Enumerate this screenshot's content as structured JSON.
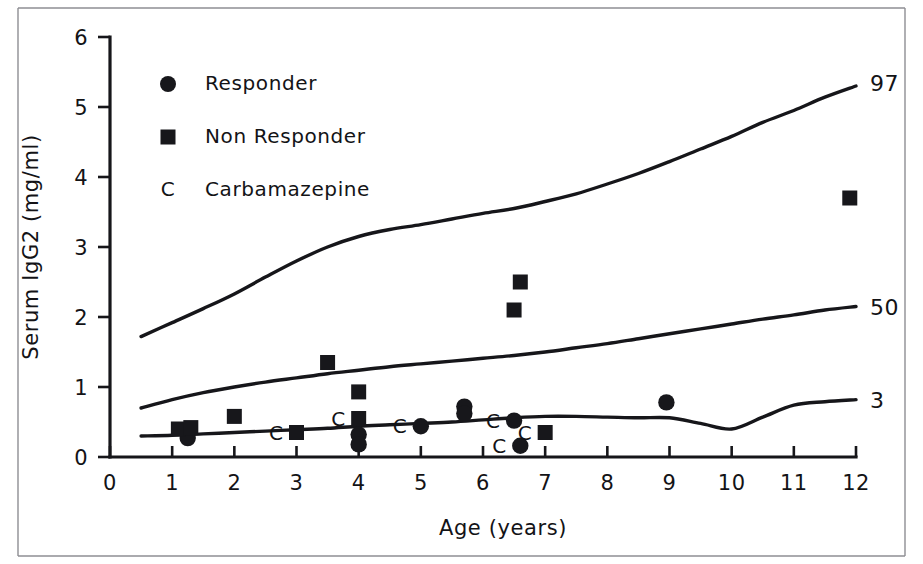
{
  "figure": {
    "background_color": "#ffffff",
    "ink_color": "#16161a"
  },
  "chart_data": {
    "type": "scatter",
    "title": "",
    "xlabel": "Age (years)",
    "ylabel": "Serum IgG2 (mg/ml)",
    "xlim": [
      0,
      12
    ],
    "ylim": [
      0,
      6
    ],
    "xticks": [
      0,
      1,
      2,
      3,
      4,
      5,
      6,
      7,
      8,
      9,
      10,
      11,
      12
    ],
    "xticklabels": [
      "0",
      "1",
      "2",
      "3",
      "4",
      "5",
      "6",
      "7",
      "8",
      "9",
      "10",
      "11",
      "12"
    ],
    "yticks": [
      0,
      1,
      2,
      3,
      4,
      5,
      6
    ],
    "yticklabels": [
      "0",
      "1",
      "2",
      "3",
      "4",
      "5",
      "6"
    ],
    "grid": false,
    "legend_position": "upper-left",
    "legend": [
      {
        "marker": "circle",
        "label": "Responder"
      },
      {
        "marker": "square",
        "label": "Non Responder"
      },
      {
        "marker": "letter-C",
        "label": "Carbamazepine"
      }
    ],
    "reference_curves": [
      {
        "name": "97th percentile",
        "label": "97",
        "label_x": 12.25,
        "label_y": 5.35,
        "points": [
          [
            0.5,
            1.72
          ],
          [
            1.0,
            1.92
          ],
          [
            1.5,
            2.12
          ],
          [
            2.0,
            2.33
          ],
          [
            2.5,
            2.57
          ],
          [
            3.0,
            2.8
          ],
          [
            3.5,
            3.0
          ],
          [
            4.0,
            3.15
          ],
          [
            4.5,
            3.25
          ],
          [
            5.0,
            3.32
          ],
          [
            5.5,
            3.4
          ],
          [
            6.0,
            3.48
          ],
          [
            6.5,
            3.55
          ],
          [
            7.0,
            3.65
          ],
          [
            7.5,
            3.76
          ],
          [
            8.0,
            3.9
          ],
          [
            8.5,
            4.05
          ],
          [
            9.0,
            4.22
          ],
          [
            9.5,
            4.4
          ],
          [
            10.0,
            4.58
          ],
          [
            10.5,
            4.78
          ],
          [
            11.0,
            4.95
          ],
          [
            11.5,
            5.14
          ],
          [
            12.0,
            5.3
          ]
        ]
      },
      {
        "name": "50th percentile",
        "label": "50",
        "label_x": 12.25,
        "label_y": 2.15,
        "points": [
          [
            0.5,
            0.7
          ],
          [
            1.0,
            0.82
          ],
          [
            1.5,
            0.92
          ],
          [
            2.0,
            1.0
          ],
          [
            2.5,
            1.07
          ],
          [
            3.0,
            1.13
          ],
          [
            3.5,
            1.19
          ],
          [
            4.0,
            1.24
          ],
          [
            4.5,
            1.29
          ],
          [
            5.0,
            1.33
          ],
          [
            5.5,
            1.37
          ],
          [
            6.0,
            1.41
          ],
          [
            6.5,
            1.45
          ],
          [
            7.0,
            1.5
          ],
          [
            7.5,
            1.56
          ],
          [
            8.0,
            1.62
          ],
          [
            8.5,
            1.69
          ],
          [
            9.0,
            1.76
          ],
          [
            9.5,
            1.83
          ],
          [
            10.0,
            1.9
          ],
          [
            10.5,
            1.97
          ],
          [
            11.0,
            2.03
          ],
          [
            11.5,
            2.1
          ],
          [
            12.0,
            2.15
          ]
        ]
      },
      {
        "name": "3rd percentile",
        "label": "3",
        "label_x": 12.25,
        "label_y": 0.82,
        "points": [
          [
            0.5,
            0.3
          ],
          [
            1.0,
            0.31
          ],
          [
            1.5,
            0.33
          ],
          [
            2.0,
            0.35
          ],
          [
            2.5,
            0.37
          ],
          [
            3.0,
            0.39
          ],
          [
            3.5,
            0.41
          ],
          [
            4.0,
            0.44
          ],
          [
            4.5,
            0.46
          ],
          [
            5.0,
            0.48
          ],
          [
            5.5,
            0.5
          ],
          [
            6.0,
            0.53
          ],
          [
            6.5,
            0.56
          ],
          [
            7.0,
            0.58
          ],
          [
            7.5,
            0.58
          ],
          [
            8.0,
            0.57
          ],
          [
            8.5,
            0.56
          ],
          [
            9.0,
            0.56
          ],
          [
            9.5,
            0.48
          ],
          [
            10.0,
            0.4
          ],
          [
            10.5,
            0.57
          ],
          [
            11.0,
            0.74
          ],
          [
            11.5,
            0.79
          ],
          [
            12.0,
            0.82
          ]
        ]
      }
    ],
    "series": [
      {
        "name": "Responder",
        "marker": "circle",
        "points": [
          {
            "x": 1.25,
            "y": 0.27,
            "carbamazepine": false
          },
          {
            "x": 4.0,
            "y": 0.32,
            "carbamazepine": false
          },
          {
            "x": 4.0,
            "y": 0.18,
            "carbamazepine": false
          },
          {
            "x": 5.0,
            "y": 0.44,
            "carbamazepine": true
          },
          {
            "x": 5.7,
            "y": 0.72,
            "carbamazepine": false
          },
          {
            "x": 5.7,
            "y": 0.62,
            "carbamazepine": false
          },
          {
            "x": 6.5,
            "y": 0.52,
            "carbamazepine": true
          },
          {
            "x": 6.6,
            "y": 0.16,
            "carbamazepine": true
          },
          {
            "x": 8.95,
            "y": 0.78,
            "carbamazepine": false
          }
        ]
      },
      {
        "name": "Non Responder",
        "marker": "square",
        "points": [
          {
            "x": 1.1,
            "y": 0.4,
            "carbamazepine": false
          },
          {
            "x": 1.3,
            "y": 0.42,
            "carbamazepine": false
          },
          {
            "x": 2.0,
            "y": 0.58,
            "carbamazepine": false
          },
          {
            "x": 3.0,
            "y": 0.35,
            "carbamazepine": true
          },
          {
            "x": 3.5,
            "y": 1.35,
            "carbamazepine": false
          },
          {
            "x": 4.0,
            "y": 0.93,
            "carbamazepine": false
          },
          {
            "x": 4.0,
            "y": 0.55,
            "carbamazepine": true
          },
          {
            "x": 6.5,
            "y": 2.1,
            "carbamazepine": false
          },
          {
            "x": 6.6,
            "y": 2.5,
            "carbamazepine": false
          },
          {
            "x": 7.0,
            "y": 0.35,
            "carbamazepine": true
          },
          {
            "x": 11.9,
            "y": 3.7,
            "carbamazepine": false
          }
        ]
      }
    ]
  }
}
